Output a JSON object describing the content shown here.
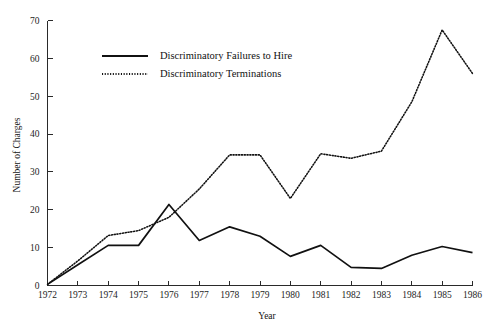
{
  "page": {
    "cutoff_text_fragment": "........",
    "background_color": "#ffffff",
    "ink_color": "#111111"
  },
  "figure": {
    "yaxis_title": "Number of Charges",
    "xaxis_title": "Year"
  },
  "legend": {
    "position": "upper-left-inside",
    "entries": [
      {
        "label": "Discriminatory Failures to Hire",
        "style": "solid"
      },
      {
        "label": "Discriminatory Terminations",
        "style": "dotted"
      }
    ]
  },
  "axes": {
    "y_ticks": [
      "0",
      "10",
      "20",
      "30",
      "40",
      "50",
      "60",
      "70"
    ],
    "x_ticks": [
      "1972",
      "1973",
      "1974",
      "1975",
      "1976",
      "1977",
      "1978",
      "1979",
      "1980",
      "1981",
      "1982",
      "1983",
      "1984",
      "1985",
      "1986"
    ]
  },
  "chart_data": {
    "type": "line",
    "title": "",
    "xlabel": "Year",
    "ylabel": "Number of Charges",
    "grid": false,
    "legend_position": "upper left (inside plot)",
    "x": [
      1972,
      1973,
      1974,
      1975,
      1976,
      1977,
      1978,
      1979,
      1980,
      1981,
      1982,
      1983,
      1984,
      1985,
      1986
    ],
    "categories": [
      "1972",
      "1973",
      "1974",
      "1975",
      "1976",
      "1977",
      "1978",
      "1979",
      "1980",
      "1981",
      "1982",
      "1983",
      "1984",
      "1985",
      "1986"
    ],
    "xlim": [
      1972,
      1986
    ],
    "ylim": [
      0,
      70
    ],
    "yticks": [
      0,
      10,
      20,
      30,
      40,
      50,
      60,
      70
    ],
    "series": [
      {
        "name": "Discriminatory Failures to Hire",
        "style": "solid",
        "color": "#111111",
        "values": [
          0.3,
          5.5,
          10.6,
          10.6,
          21.4,
          11.9,
          15.5,
          13.0,
          7.7,
          10.6,
          4.8,
          4.5,
          8.0,
          10.3,
          8.7
        ]
      },
      {
        "name": "Discriminatory Terminations",
        "style": "dotted",
        "color": "#111111",
        "values": [
          0.3,
          6.5,
          13.2,
          14.5,
          18.0,
          25.5,
          34.5,
          34.5,
          23.0,
          34.8,
          33.6,
          35.5,
          48.5,
          67.5,
          56.0
        ]
      }
    ]
  }
}
